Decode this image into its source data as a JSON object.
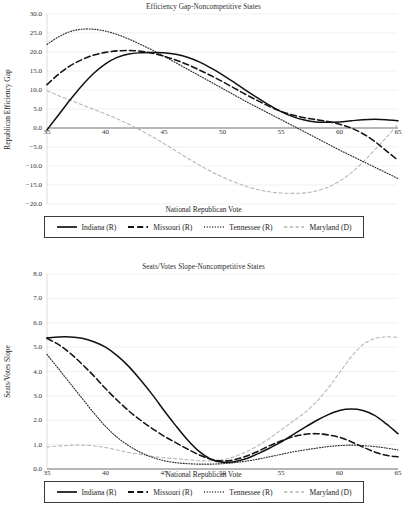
{
  "charts": [
    {
      "title": "Efficiency Gap-Noncompetitive States",
      "xlabel": "National Republican Vote",
      "ylabel": "Republican Efficiency Gap"
    },
    {
      "title": "Seats/Votes Slope-Noncompetitive States",
      "xlabel": "National Republican Vote",
      "ylabel": "Seats/Votes Slope"
    }
  ],
  "legend": {
    "items": [
      {
        "label": "Indiana (R)",
        "style": "solid",
        "color": "#111111",
        "icon": "solid-line-icon"
      },
      {
        "label": "Missouri (R)",
        "style": "dashed",
        "color": "#141414",
        "icon": "dashed-line-icon"
      },
      {
        "label": "Tennessee (R)",
        "style": "dotted",
        "color": "#2e2e2e",
        "icon": "dotted-line-icon"
      },
      {
        "label": "Maryland (D)",
        "style": "loose-dashed",
        "color": "#b4b4b4",
        "icon": "light-dashed-line-icon"
      }
    ]
  },
  "chart_data": [
    {
      "type": "line",
      "title": "Efficiency Gap-Noncompetitive States",
      "xlabel": "National Republican Vote",
      "ylabel": "Republican Efficiency Gap",
      "xlim": [
        35,
        65
      ],
      "ylim": [
        -20.0,
        30.0
      ],
      "xticks": [
        35,
        40,
        45,
        50,
        55,
        60,
        65
      ],
      "yticks": [
        30.0,
        25.0,
        20.0,
        15.0,
        10.0,
        5.0,
        0.0,
        -5.0,
        -10.0,
        -15.0,
        -20.0
      ],
      "grid": true,
      "legend_position": "bottom",
      "x": [
        35,
        36,
        37,
        38,
        39,
        40,
        41,
        42,
        43,
        44,
        45,
        46,
        47,
        48,
        49,
        50,
        51,
        52,
        53,
        54,
        55,
        56,
        57,
        58,
        59,
        60,
        61,
        62,
        63,
        64,
        65
      ],
      "series": [
        {
          "name": "Indiana (R)",
          "style": "solid",
          "color": "#111111",
          "values": [
            -0.5,
            3.5,
            7.5,
            11.2,
            14.4,
            16.9,
            18.6,
            19.5,
            19.8,
            19.9,
            19.8,
            19.4,
            18.6,
            17.4,
            15.8,
            14.0,
            12.0,
            9.9,
            7.9,
            6.0,
            4.3,
            3.0,
            2.1,
            1.6,
            1.5,
            1.6,
            1.9,
            2.2,
            2.3,
            2.2,
            1.9
          ]
        },
        {
          "name": "Missouri (R)",
          "style": "dashed",
          "color": "#141414",
          "values": [
            11.4,
            14.2,
            16.4,
            18.0,
            19.2,
            19.9,
            20.3,
            20.4,
            20.2,
            19.7,
            18.9,
            17.9,
            16.7,
            15.3,
            13.8,
            12.2,
            10.5,
            8.8,
            7.2,
            5.7,
            4.4,
            3.4,
            2.7,
            2.2,
            1.7,
            1.0,
            0.0,
            -1.5,
            -3.5,
            -6.0,
            -8.5
          ]
        },
        {
          "name": "Tennessee (R)",
          "style": "dotted",
          "color": "#2e2e2e",
          "values": [
            22.0,
            24.0,
            25.4,
            26.0,
            26.0,
            25.5,
            24.6,
            23.4,
            22.0,
            20.5,
            18.9,
            17.2,
            15.5,
            13.8,
            12.1,
            10.4,
            8.7,
            7.0,
            5.4,
            3.8,
            2.2,
            0.6,
            -1.0,
            -2.6,
            -4.2,
            -5.8,
            -7.3,
            -8.8,
            -10.3,
            -11.8,
            -13.3
          ]
        },
        {
          "name": "Maryland (D)",
          "style": "loose-dashed",
          "color": "#b4b4b4",
          "values": [
            9.8,
            8.5,
            7.3,
            6.1,
            4.9,
            3.7,
            2.4,
            1.0,
            -0.6,
            -2.3,
            -4.1,
            -6.0,
            -7.9,
            -9.7,
            -11.4,
            -12.9,
            -14.2,
            -15.3,
            -16.2,
            -16.8,
            -17.1,
            -17.2,
            -17.1,
            -16.6,
            -15.6,
            -14.0,
            -11.8,
            -9.0,
            -5.8,
            -2.5,
            1.0
          ]
        }
      ]
    },
    {
      "type": "line",
      "title": "Seats/Votes Slope-Noncompetitive States",
      "xlabel": "National Republican Vote",
      "ylabel": "Seats/Votes Slope",
      "xlim": [
        35,
        65
      ],
      "ylim": [
        0.0,
        8.0
      ],
      "xticks": [
        35,
        40,
        45,
        50,
        55,
        60,
        65
      ],
      "yticks": [
        8.0,
        7.0,
        6.0,
        5.0,
        4.0,
        3.0,
        2.0,
        1.0,
        0.0
      ],
      "grid": true,
      "legend_position": "bottom",
      "x": [
        35,
        36,
        37,
        38,
        39,
        40,
        41,
        42,
        43,
        44,
        45,
        46,
        47,
        48,
        49,
        50,
        51,
        52,
        53,
        54,
        55,
        56,
        57,
        58,
        59,
        60,
        61,
        62,
        63,
        64,
        65
      ],
      "series": [
        {
          "name": "Indiana (R)",
          "style": "solid",
          "color": "#111111",
          "values": [
            5.38,
            5.42,
            5.42,
            5.36,
            5.22,
            5.0,
            4.65,
            4.2,
            3.65,
            3.05,
            2.4,
            1.78,
            1.2,
            0.72,
            0.4,
            0.28,
            0.3,
            0.42,
            0.62,
            0.85,
            1.1,
            1.4,
            1.7,
            1.98,
            2.22,
            2.4,
            2.46,
            2.4,
            2.2,
            1.85,
            1.45
          ]
        },
        {
          "name": "Missouri (R)",
          "style": "dashed",
          "color": "#141414",
          "values": [
            5.36,
            5.1,
            4.74,
            4.3,
            3.82,
            3.3,
            2.82,
            2.38,
            2.0,
            1.66,
            1.35,
            1.08,
            0.82,
            0.58,
            0.4,
            0.33,
            0.38,
            0.52,
            0.72,
            0.95,
            1.15,
            1.32,
            1.42,
            1.45,
            1.4,
            1.3,
            1.12,
            0.9,
            0.7,
            0.56,
            0.5
          ]
        },
        {
          "name": "Tennessee (R)",
          "style": "dotted",
          "color": "#2e2e2e",
          "values": [
            4.7,
            4.1,
            3.5,
            2.9,
            2.3,
            1.75,
            1.3,
            0.95,
            0.68,
            0.48,
            0.34,
            0.26,
            0.22,
            0.2,
            0.2,
            0.22,
            0.26,
            0.32,
            0.4,
            0.5,
            0.6,
            0.7,
            0.78,
            0.85,
            0.92,
            0.96,
            0.98,
            0.96,
            0.92,
            0.86,
            0.78
          ]
        },
        {
          "name": "Maryland (D)",
          "style": "loose-dashed",
          "color": "#b4b4b4",
          "values": [
            0.9,
            0.94,
            0.97,
            0.98,
            0.95,
            0.88,
            0.78,
            0.68,
            0.6,
            0.52,
            0.46,
            0.42,
            0.38,
            0.34,
            0.33,
            0.38,
            0.5,
            0.7,
            0.95,
            1.25,
            1.6,
            1.95,
            2.3,
            2.75,
            3.3,
            3.95,
            4.6,
            5.1,
            5.35,
            5.42,
            5.4
          ]
        }
      ]
    }
  ]
}
